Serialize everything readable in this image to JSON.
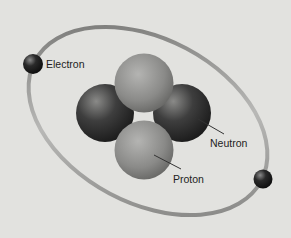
{
  "diagram": {
    "labels": {
      "electron": "Electron",
      "neutron": "Neutron",
      "proton": "Proton"
    },
    "particles": {
      "electrons": 2,
      "protons": 2,
      "neutrons": 2
    },
    "colors": {
      "background": "#e2e2df",
      "orbit": "#9a9a98",
      "electron": "#1c1c1c",
      "neutron": "#2e2e2e",
      "proton": "#8a8a88",
      "label_text": "#222222",
      "leader_line": "#333333"
    }
  }
}
